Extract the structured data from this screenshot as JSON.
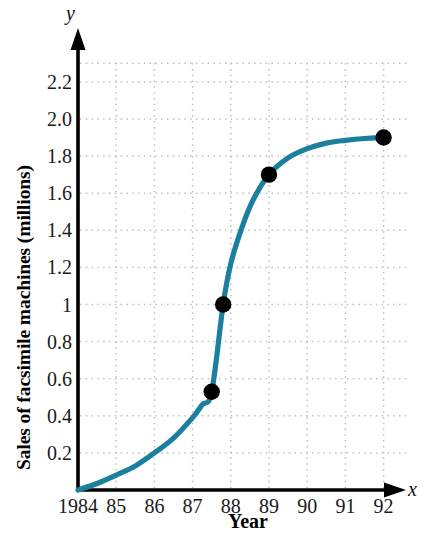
{
  "chart_data": {
    "type": "line",
    "title": "",
    "xlabel": "Year",
    "ylabel": "Sales of facsimile machines (millions)",
    "x_axis_name": "x",
    "y_axis_name": "y",
    "xlim": [
      1984,
      1992.6
    ],
    "ylim": [
      0,
      2.32
    ],
    "grid": true,
    "legend": false,
    "line_color": "#1b7f9e",
    "point_color": "#000000",
    "gridline_color": "#bfbfbf",
    "axis_color": "#000000",
    "x_tick_labels": [
      "1984",
      "85",
      "86",
      "87",
      "88",
      "89",
      "90",
      "91",
      "92"
    ],
    "x_tick_values": [
      1984,
      1985,
      1986,
      1987,
      1988,
      1989,
      1990,
      1991,
      1992
    ],
    "y_tick_labels": [
      "0.2",
      "0.4",
      "0.6",
      "0.8",
      "1",
      "1.2",
      "1.4",
      "1.6",
      "1.8",
      "2.0",
      "2.2"
    ],
    "y_tick_values": [
      0.2,
      0.4,
      0.6,
      0.8,
      1.0,
      1.2,
      1.4,
      1.6,
      1.8,
      2.0,
      2.2
    ],
    "series": [
      {
        "name": "Sales of facsimile machines",
        "x": [
          1984,
          1984.5,
          1985,
          1985.5,
          1986,
          1986.5,
          1987,
          1987.25,
          1987.5,
          1987.8,
          1988,
          1988.3,
          1988.6,
          1989,
          1989.5,
          1990,
          1990.5,
          1991,
          1991.5,
          1992
        ],
        "values": [
          0.0,
          0.035,
          0.08,
          0.13,
          0.2,
          0.28,
          0.39,
          0.46,
          0.53,
          1.0,
          1.22,
          1.42,
          1.57,
          1.7,
          1.79,
          1.84,
          1.87,
          1.885,
          1.895,
          1.9
        ]
      }
    ],
    "marked_points": [
      {
        "x": 1987.5,
        "y": 0.53
      },
      {
        "x": 1987.8,
        "y": 1.0
      },
      {
        "x": 1989.0,
        "y": 1.7
      },
      {
        "x": 1992.0,
        "y": 1.9
      }
    ]
  }
}
